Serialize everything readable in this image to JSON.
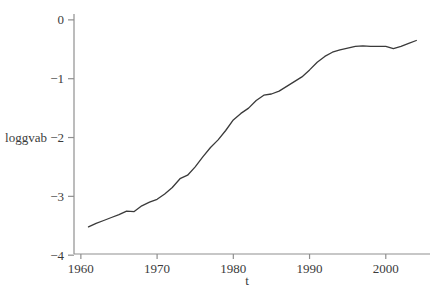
{
  "figure": {
    "background": "#ffffff",
    "line_color": "#3a3a3a",
    "axis_color": "#8f8f8f",
    "text_color": "#3b3b3b"
  },
  "chart_data": {
    "type": "line",
    "title": "",
    "xlabel": "t",
    "ylabel": "loggvab",
    "grid": false,
    "legend": null,
    "xlim": [
      1959.1,
      2005.8
    ],
    "ylim": [
      -3.98,
      0.1
    ],
    "xticks": {
      "values": [
        1960,
        1970,
        1980,
        1990,
        2000
      ],
      "labels": [
        "1960",
        "1970",
        "1980",
        "1990",
        "2000"
      ]
    },
    "yticks": {
      "values": [
        0,
        -1,
        -2,
        -3,
        -4
      ],
      "labels": [
        "0",
        "−1",
        "−2",
        "−3",
        "−4"
      ]
    },
    "x": [
      1961,
      1962,
      1963,
      1964,
      1965,
      1966,
      1967,
      1968,
      1969,
      1970,
      1971,
      1972,
      1973,
      1974,
      1975,
      1976,
      1977,
      1978,
      1979,
      1980,
      1981,
      1982,
      1983,
      1984,
      1985,
      1986,
      1987,
      1988,
      1989,
      1990,
      1991,
      1992,
      1993,
      1994,
      1995,
      1996,
      1997,
      1998,
      1999,
      2000,
      2001,
      2002,
      2003,
      2004
    ],
    "values": [
      -3.52,
      -3.46,
      -3.41,
      -3.36,
      -3.31,
      -3.25,
      -3.26,
      -3.16,
      -3.1,
      -3.05,
      -2.96,
      -2.85,
      -2.7,
      -2.64,
      -2.5,
      -2.33,
      -2.17,
      -2.04,
      -1.88,
      -1.7,
      -1.59,
      -1.5,
      -1.37,
      -1.28,
      -1.26,
      -1.21,
      -1.13,
      -1.05,
      -0.97,
      -0.85,
      -0.72,
      -0.62,
      -0.55,
      -0.51,
      -0.48,
      -0.45,
      -0.44,
      -0.45,
      -0.45,
      -0.45,
      -0.49,
      -0.45,
      -0.4,
      -0.35
    ]
  }
}
